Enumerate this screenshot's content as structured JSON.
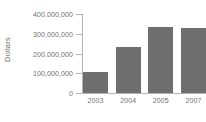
{
  "chart_data": {
    "type": "bar",
    "title": "",
    "subtitle": "",
    "xlabel": "",
    "ylabel": "Dollars",
    "categories": [
      "2003",
      "2004",
      "2005",
      "2007"
    ],
    "values": [
      105000000,
      235000000,
      335000000,
      330000000
    ],
    "series": [
      {
        "name": "Dollars",
        "values": [
          105000000,
          235000000,
          335000000,
          330000000
        ]
      }
    ],
    "ylim": [
      0,
      400000000
    ],
    "y_ticks": [
      0,
      100000000,
      200000000,
      300000000,
      400000000
    ],
    "y_tick_labels": [
      "0",
      "100,000,000",
      "200,000,000",
      "300,000,000",
      "400,000,000"
    ],
    "grid": false,
    "legend": false,
    "legend_position": "none",
    "annotations": [],
    "colors": {
      "bar_fill": "#6e6e6e",
      "axis_line": "#b4b4b4",
      "tick_text": "#707070",
      "axis_title": "#6f6f6f",
      "background": "#ffffff"
    }
  }
}
